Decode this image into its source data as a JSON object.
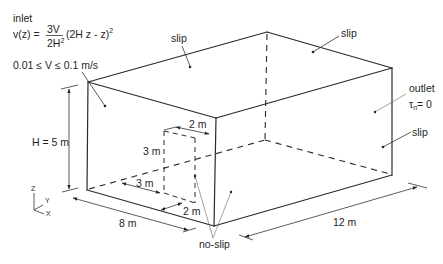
{
  "labels": {
    "inlet": "inlet",
    "formula": {
      "lhs": "v(z) =",
      "numerator": "3V",
      "denominator_base": "2H",
      "denominator_exp": "2",
      "rhs_base": "(2H z - z)",
      "rhs_exp": "2"
    },
    "velocity_range": "0.01 ≤ V ≤ 0.1 m/s",
    "slip_top_left": "slip",
    "slip_top_right": "slip",
    "outlet": "outlet",
    "outlet_condition": {
      "symbol": "τ",
      "subscript": "n",
      "rest": "= 0"
    },
    "slip_right": "slip",
    "no_slip": "no-slip"
  },
  "dimensions": {
    "height": "H = 5 m",
    "width": "8 m",
    "length": "12 m",
    "obstacle_height": "3 m",
    "obstacle_offset": "3 m",
    "obstacle_top_width": "2 m",
    "obstacle_bottom_width": "2 m"
  },
  "axes": {
    "z": "Z",
    "y": "Y",
    "x": "X"
  },
  "colors": {
    "line": "#2a2a2a",
    "text": "#1f1f1f",
    "background": "#ffffff"
  }
}
